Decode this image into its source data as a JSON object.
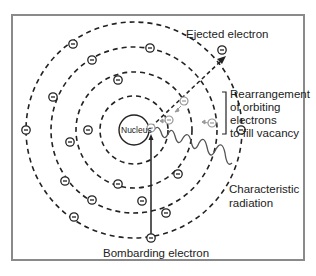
{
  "diagram": {
    "type": "atomic model - characteristic x-ray production",
    "labels": {
      "nucleus": "Nucleus",
      "ejected_electron": "Ejected electron",
      "rearrangement": [
        "Rearrangement",
        "of orbiting",
        "electrons",
        "to fill vacancy"
      ],
      "characteristic_radiation": [
        "Characteristic",
        "radiation"
      ],
      "bombarding_electron": "Bombarding electron"
    },
    "electron_symbol": "−",
    "colors": {
      "frame": "#8a8a8a",
      "lines": "#222222",
      "faded_electrons": "#999999",
      "wave": "#555555"
    }
  }
}
